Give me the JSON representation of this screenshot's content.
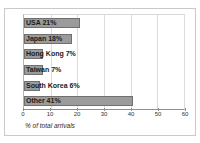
{
  "page": {
    "top_caption": "",
    "bottom_caption": ""
  },
  "colors": {
    "bar_fill": "#9b9b9b",
    "bar_border": "#6f6f6f",
    "gridline": "#dcdcdc",
    "axis": "#8f8f8f",
    "frame": "#c9c9c9",
    "background": "#ffffff",
    "label_text": "#1a1a1a"
  },
  "chart_data": {
    "type": "bar",
    "orientation": "horizontal",
    "title": "",
    "subtitle": "",
    "xlabel": "% of total arrivals",
    "ylabel": "",
    "xlim": [
      0,
      60
    ],
    "xticks": [
      0,
      10,
      20,
      30,
      40,
      50,
      60
    ],
    "xtick_labels": [
      "0",
      "10",
      "20",
      "30",
      "40",
      "50",
      "60"
    ],
    "grid": "vertical",
    "legend": "none",
    "categories": [
      "USA",
      "Japan",
      "Hong Kong",
      "Taiwan",
      "South Korea",
      "Other"
    ],
    "values": [
      21,
      18,
      7,
      7,
      6,
      41
    ],
    "bar_labels": [
      "USA 21%",
      "Japan 18%",
      "Hong Kong 7%",
      "Taiwan 7%",
      "South Korea 6%",
      "Other 41%"
    ]
  }
}
